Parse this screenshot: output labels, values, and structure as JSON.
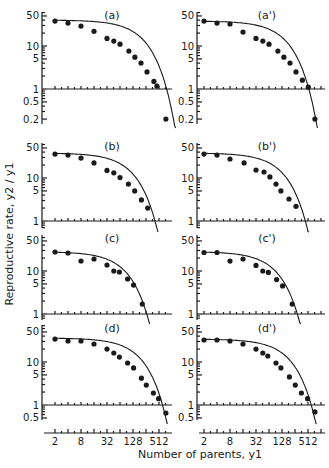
{
  "chart_data": {
    "type": "scatter",
    "xlabel": "Number of parents, y1",
    "ylabel": "Reproductive rate, y2 / y1",
    "xscale": "log2",
    "yscale": "log10",
    "x_tick_labels": [
      "2",
      "8",
      "32",
      "128",
      "512"
    ],
    "x_ticks": [
      2,
      8,
      32,
      128,
      512
    ],
    "xlim": [
      1.6,
      900
    ],
    "panels": [
      {
        "label": "(a)",
        "ylim": [
          0.15,
          60
        ],
        "y_ticks": [
          50,
          10,
          5,
          1,
          0.5,
          0.2
        ],
        "y_tick_labels": [
          "50",
          "10",
          "5",
          "1",
          "0.5",
          "0.2"
        ],
        "points": [
          [
            2,
            38
          ],
          [
            4,
            34
          ],
          [
            8,
            29
          ],
          [
            16,
            22
          ],
          [
            32,
            15
          ],
          [
            46,
            13
          ],
          [
            64,
            11
          ],
          [
            103,
            7.6
          ],
          [
            142,
            5.5
          ],
          [
            196,
            4.0
          ],
          [
            270,
            2.5
          ],
          [
            390,
            1.5
          ],
          [
            458,
            1.17
          ],
          [
            740,
            0.2
          ]
        ],
        "curve": {
          "a": 40,
          "k": 0.0048
        }
      },
      {
        "label": "(a')",
        "ylim": [
          0.15,
          60
        ],
        "y_ticks": [
          50,
          10,
          5,
          1,
          0.5,
          0.2
        ],
        "y_tick_labels": [
          "50",
          "10",
          "5",
          "1",
          "0.5",
          "0.2"
        ],
        "points": [
          [
            2,
            38
          ],
          [
            4,
            34
          ],
          [
            8,
            32.5
          ],
          [
            16,
            21
          ],
          [
            32,
            15
          ],
          [
            46,
            13
          ],
          [
            64,
            11
          ],
          [
            103,
            7.6
          ],
          [
            142,
            5.5
          ],
          [
            196,
            4.0
          ],
          [
            270,
            2.5
          ],
          [
            380,
            1.6
          ],
          [
            520,
            1.1
          ],
          [
            740,
            0.2
          ]
        ],
        "curve": {
          "a": 38,
          "k": 0.0068
        }
      },
      {
        "label": "(b)",
        "ylim": [
          0.7,
          60
        ],
        "y_ticks": [
          50,
          10,
          5,
          1
        ],
        "y_tick_labels": [
          "50",
          "10",
          "5",
          "1"
        ],
        "points": [
          [
            2,
            36
          ],
          [
            4,
            34
          ],
          [
            8,
            29
          ],
          [
            16,
            22.4
          ],
          [
            32,
            15
          ],
          [
            46,
            13.2
          ],
          [
            64,
            10.2
          ],
          [
            100,
            7.2
          ],
          [
            140,
            5
          ],
          [
            200,
            3.1
          ],
          [
            280,
            2.0
          ]
        ],
        "curve": {
          "a": 38,
          "k": 0.0088
        }
      },
      {
        "label": "(b')",
        "ylim": [
          0.7,
          60
        ],
        "y_ticks": [
          50,
          10,
          5,
          1
        ],
        "y_tick_labels": [
          "50",
          "10",
          "5",
          "1"
        ],
        "points": [
          [
            2,
            36
          ],
          [
            4,
            34
          ],
          [
            8,
            27.6
          ],
          [
            17,
            22.4
          ],
          [
            32,
            15.3
          ],
          [
            49,
            13.8
          ],
          [
            67,
            10.6
          ],
          [
            93,
            7.2
          ],
          [
            121,
            5
          ],
          [
            186,
            3.25
          ],
          [
            270,
            2.2
          ]
        ],
        "curve": {
          "a": 38,
          "k": 0.0082
        }
      },
      {
        "label": "(c)",
        "ylim": [
          0.7,
          60
        ],
        "y_ticks": [
          50,
          10,
          5,
          1
        ],
        "y_tick_labels": [
          "50",
          "10",
          "5",
          "1"
        ],
        "points": [
          [
            2,
            27.6
          ],
          [
            4,
            26.2
          ],
          [
            8,
            17.1
          ],
          [
            16,
            19
          ],
          [
            32,
            13.8
          ],
          [
            46,
            10
          ],
          [
            62,
            9.5
          ],
          [
            96,
            6.5
          ],
          [
            132,
            4.7
          ],
          [
            210,
            1.7
          ]
        ],
        "curve": {
          "a": 28,
          "k": 0.0125
        }
      },
      {
        "label": "(c')",
        "ylim": [
          0.7,
          60
        ],
        "y_ticks": [
          50,
          10,
          5,
          1
        ],
        "y_tick_labels": [
          "50",
          "10",
          "5",
          "1"
        ],
        "points": [
          [
            2,
            27
          ],
          [
            4,
            27
          ],
          [
            8,
            17
          ],
          [
            16,
            19
          ],
          [
            32,
            13.5
          ],
          [
            46,
            10
          ],
          [
            62,
            9.3
          ],
          [
            96,
            6.3
          ],
          [
            132,
            4.5
          ],
          [
            220,
            1.7
          ]
        ],
        "curve": {
          "a": 28,
          "k": 0.0115
        }
      },
      {
        "label": "(d)",
        "ylim": [
          0.35,
          60
        ],
        "y_ticks": [
          50,
          10,
          5,
          1,
          0.5
        ],
        "y_tick_labels": [
          "50",
          "10",
          "5",
          "1",
          "0.5"
        ],
        "points": [
          [
            2,
            34
          ],
          [
            4,
            30.8
          ],
          [
            8,
            30.8
          ],
          [
            16,
            26.2
          ],
          [
            32,
            20
          ],
          [
            46,
            16.2
          ],
          [
            62,
            13
          ],
          [
            96,
            9.5
          ],
          [
            132,
            7.3
          ],
          [
            200,
            4.2
          ],
          [
            260,
            2.9
          ],
          [
            380,
            1.9
          ],
          [
            500,
            1.4
          ],
          [
            740,
            0.65
          ]
        ],
        "curve": {
          "a": 36,
          "k": 0.0058
        }
      },
      {
        "label": "(d')",
        "ylim": [
          0.35,
          60
        ],
        "y_ticks": [
          50,
          10,
          5,
          1,
          0.5
        ],
        "y_tick_labels": [
          "50",
          "10",
          "5",
          "1",
          "0.5"
        ],
        "points": [
          [
            2,
            32.4
          ],
          [
            4,
            32.4
          ],
          [
            8,
            30.8
          ],
          [
            16,
            26.2
          ],
          [
            32,
            20
          ],
          [
            46,
            16.2
          ],
          [
            60,
            13.8
          ],
          [
            93,
            9.5
          ],
          [
            121,
            7.3
          ],
          [
            190,
            4.5
          ],
          [
            260,
            2.9
          ],
          [
            360,
            1.9
          ],
          [
            500,
            1.4
          ],
          [
            740,
            0.69
          ]
        ],
        "curve": {
          "a": 34,
          "k": 0.0058
        }
      }
    ]
  }
}
